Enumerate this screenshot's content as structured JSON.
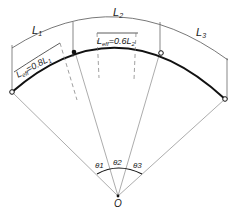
{
  "diagram": {
    "spans": [
      {
        "label": "L",
        "sub": "1"
      },
      {
        "label": "L",
        "sub": "2"
      },
      {
        "label": "L",
        "sub": "3"
      }
    ],
    "effective_lengths": [
      {
        "label": "L",
        "sub": "eff",
        "eq": "=0.8L",
        "eq_sub": "1"
      },
      {
        "label": "L",
        "sub": "eff",
        "eq": "=0.6L",
        "eq_sub": "2"
      }
    ],
    "angles": [
      {
        "label": "θ1"
      },
      {
        "label": "θ2"
      },
      {
        "label": "θ3"
      }
    ],
    "center": {
      "label": "O"
    }
  }
}
